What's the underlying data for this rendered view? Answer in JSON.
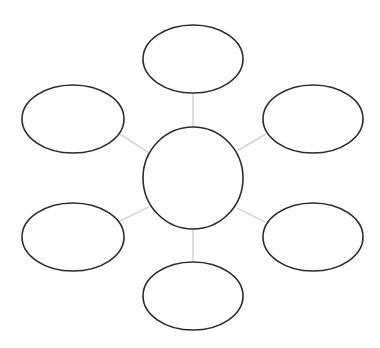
{
  "diagram": {
    "type": "bubble-map",
    "colors": {
      "background": "#ffffff",
      "node_stroke": "#2b2b2b",
      "node_fill": "#ffffff",
      "connector": "#d4d4d4"
    },
    "center": {
      "id": "center",
      "label": "",
      "shape": "circle",
      "cx": 193,
      "cy": 178,
      "rx": 50,
      "ry": 51
    },
    "nodes": [
      {
        "id": "top",
        "label": "",
        "cx": 193,
        "cy": 59,
        "rx": 50,
        "ry": 34
      },
      {
        "id": "top-left",
        "label": "",
        "cx": 73,
        "cy": 119,
        "rx": 51,
        "ry": 34
      },
      {
        "id": "top-right",
        "label": "",
        "cx": 313,
        "cy": 119,
        "rx": 50,
        "ry": 34
      },
      {
        "id": "bottom-left",
        "label": "",
        "cx": 73,
        "cy": 237,
        "rx": 51,
        "ry": 34
      },
      {
        "id": "bottom-right",
        "label": "",
        "cx": 313,
        "cy": 237,
        "rx": 50,
        "ry": 34
      },
      {
        "id": "bottom",
        "label": "",
        "cx": 193,
        "cy": 296,
        "rx": 50,
        "ry": 34
      }
    ],
    "connectors": [
      {
        "from": "center",
        "to": "top",
        "x1": 193,
        "y1": 127,
        "x2": 193,
        "y2": 93
      },
      {
        "from": "center",
        "to": "top-left",
        "x1": 149,
        "y1": 153,
        "x2": 120,
        "y2": 134
      },
      {
        "from": "center",
        "to": "top-right",
        "x1": 237,
        "y1": 151,
        "x2": 266,
        "y2": 134
      },
      {
        "from": "center",
        "to": "bottom-left",
        "x1": 149,
        "y1": 207,
        "x2": 120,
        "y2": 221
      },
      {
        "from": "center",
        "to": "bottom-right",
        "x1": 237,
        "y1": 208,
        "x2": 265,
        "y2": 222
      },
      {
        "from": "center",
        "to": "bottom",
        "x1": 193,
        "y1": 229,
        "x2": 193,
        "y2": 262
      }
    ]
  }
}
